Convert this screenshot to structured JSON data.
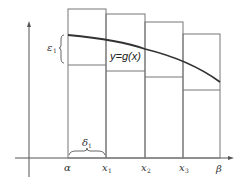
{
  "diagram": {
    "curve_label": "y=g(x)",
    "epsilon_label": "ε",
    "epsilon_sub": "1",
    "delta_label": "δ",
    "delta_sub": "1",
    "x_ticks": [
      {
        "label": "α",
        "sub": ""
      },
      {
        "label": "x",
        "sub": "1"
      },
      {
        "label": "x",
        "sub": "2"
      },
      {
        "label": "x",
        "sub": "3"
      },
      {
        "label": "β",
        "sub": ""
      }
    ],
    "colors": {
      "axis": "#555555",
      "rect": "#777777",
      "curve": "#333333",
      "text": "#333333"
    }
  }
}
